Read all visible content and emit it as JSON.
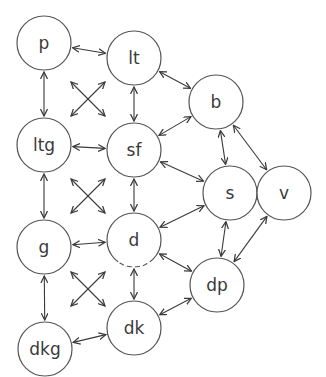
{
  "diagram": {
    "type": "graph",
    "nodes": [
      {
        "id": "p",
        "label": "p",
        "x": 44,
        "y": 43,
        "r": 27
      },
      {
        "id": "lt",
        "label": "lt",
        "x": 134,
        "y": 58,
        "r": 27
      },
      {
        "id": "b",
        "label": "b",
        "x": 216,
        "y": 102,
        "r": 27
      },
      {
        "id": "ltg",
        "label": "ltg",
        "x": 44,
        "y": 145,
        "r": 27
      },
      {
        "id": "sf",
        "label": "sf",
        "x": 134,
        "y": 150,
        "r": 27
      },
      {
        "id": "s",
        "label": "s",
        "x": 230,
        "y": 193,
        "r": 27
      },
      {
        "id": "v",
        "label": "v",
        "x": 284,
        "y": 193,
        "r": 27
      },
      {
        "id": "g",
        "label": "g",
        "x": 44,
        "y": 247,
        "r": 27
      },
      {
        "id": "d",
        "label": "d",
        "x": 134,
        "y": 240,
        "r": 27,
        "dashed_bottom": true
      },
      {
        "id": "dp",
        "label": "dp",
        "x": 217,
        "y": 285,
        "r": 27
      },
      {
        "id": "dkg",
        "label": "dkg",
        "x": 45,
        "y": 349,
        "r": 27
      },
      {
        "id": "dk",
        "label": "dk",
        "x": 134,
        "y": 328,
        "r": 27
      }
    ],
    "edges": [
      {
        "from": "p",
        "to": "lt",
        "bidirectional": true
      },
      {
        "from": "p",
        "to": "ltg",
        "bidirectional": true
      },
      {
        "from": "lt",
        "to": "sf",
        "bidirectional": true
      },
      {
        "from": "lt",
        "to": "b",
        "bidirectional": true
      },
      {
        "from": "ltg",
        "to": "sf",
        "bidirectional": true
      },
      {
        "from": "ltg",
        "to": "g",
        "bidirectional": true
      },
      {
        "from": "sf",
        "to": "b",
        "bidirectional": true
      },
      {
        "from": "sf",
        "to": "s",
        "bidirectional": true
      },
      {
        "from": "sf",
        "to": "d",
        "bidirectional": true
      },
      {
        "from": "b",
        "to": "s",
        "bidirectional": true
      },
      {
        "from": "b",
        "to": "v",
        "bidirectional": true
      },
      {
        "from": "s",
        "to": "v",
        "bidirectional": true
      },
      {
        "from": "d",
        "to": "s",
        "bidirectional": true
      },
      {
        "from": "g",
        "to": "d",
        "bidirectional": true
      },
      {
        "from": "d",
        "to": "dp",
        "bidirectional": true
      },
      {
        "from": "d",
        "to": "dk",
        "bidirectional": true
      },
      {
        "from": "s",
        "to": "dp",
        "bidirectional": true
      },
      {
        "from": "v",
        "to": "dp",
        "bidirectional": true
      },
      {
        "from": "g",
        "to": "dkg",
        "bidirectional": true
      },
      {
        "from": "dk",
        "to": "dp",
        "bidirectional": true
      },
      {
        "from": "dkg",
        "to": "dk",
        "bidirectional": true
      }
    ],
    "cross_markers": [
      {
        "cx": 88,
        "cy": 99,
        "half": 17
      },
      {
        "cx": 88,
        "cy": 196,
        "half": 17
      },
      {
        "cx": 88,
        "cy": 289,
        "half": 17
      }
    ],
    "colors": {
      "stroke": "#555555",
      "edge": "#3a3a3a",
      "label": "#3a3a3a",
      "background": "#ffffff"
    }
  }
}
